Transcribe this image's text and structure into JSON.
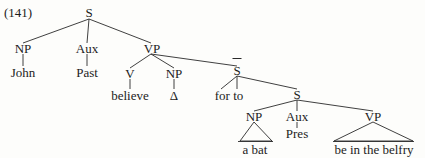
{
  "figure": {
    "example_number": "(141)",
    "type": "syntax-tree"
  },
  "nodes": {
    "s_top": "S",
    "np_subject": "NP",
    "aux_matrix": "Aux",
    "vp_matrix": "VP",
    "v_matrix": "V",
    "np_object": "NP",
    "s_bar": "S",
    "s_embedded": "S",
    "np_embedded": "NP",
    "aux_embedded": "Aux",
    "vp_embedded": "VP"
  },
  "leaves": {
    "john": "John",
    "past": "Past",
    "believe": "believe",
    "delta": "Δ",
    "for_to": "for  to",
    "a_bat": "a bat",
    "be_in_the_belfry": "be in the belfry"
  },
  "colors": {
    "ink": "#1c1c1c",
    "line": "#2a2a2a",
    "background": "#fdfdfb"
  }
}
